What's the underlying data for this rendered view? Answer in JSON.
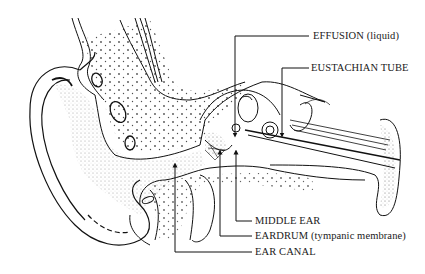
{
  "diagram": {
    "labels": [
      {
        "id": "effusion",
        "text": "EFFUSION (liquid)",
        "x": 313,
        "y": 30
      },
      {
        "id": "eustachian-tube",
        "text": "EUSTACHIAN TUBE",
        "x": 311,
        "y": 62
      },
      {
        "id": "middle-ear",
        "text": "MIDDLE EAR",
        "x": 255,
        "y": 215
      },
      {
        "id": "eardrum",
        "text": "EARDRUM (tympanic membrane)",
        "x": 255,
        "y": 230
      },
      {
        "id": "ear-canal",
        "text": "EAR CANAL",
        "x": 255,
        "y": 246
      }
    ],
    "colors": {
      "ink": "#1a1a1a",
      "paper": "#ffffff"
    }
  }
}
